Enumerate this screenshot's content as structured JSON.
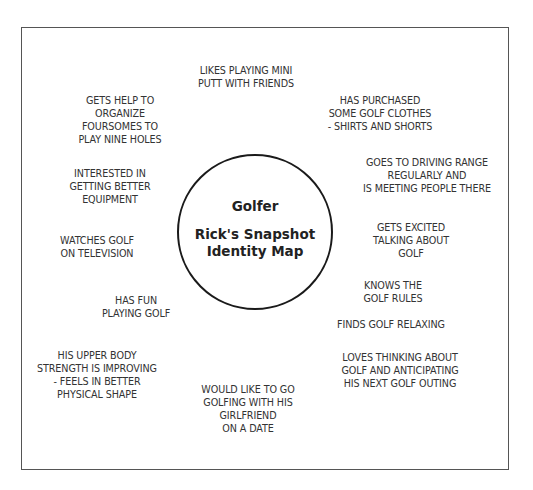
{
  "diagram": {
    "type": "identity-map",
    "center": {
      "title": "Golfer",
      "subtitle_line1": "Rick's Snapshot",
      "subtitle_line2": "Identity Map"
    },
    "notes": [
      {
        "id": "mini-putt",
        "text": "LIKES PLAYING MINI\nPUTT WITH FRIENDS"
      },
      {
        "id": "organize-foursomes",
        "text": "GETS HELP TO\nORGANIZE\nFOURSOMES TO\nPLAY NINE HOLES"
      },
      {
        "id": "golf-clothes",
        "text": "HAS PURCHASED\nSOME GOLF CLOTHES\n- SHIRTS AND SHORTS"
      },
      {
        "id": "better-equipment",
        "text": "INTERESTED IN\nGETTING BETTER\nEQUIPMENT"
      },
      {
        "id": "driving-range",
        "text": "GOES TO DRIVING RANGE\nREGULARLY AND\nIS MEETING PEOPLE THERE"
      },
      {
        "id": "watches-golf",
        "text": "WATCHES GOLF\nON TELEVISION"
      },
      {
        "id": "gets-excited",
        "text": "GETS EXCITED\nTALKING ABOUT\nGOLF"
      },
      {
        "id": "has-fun",
        "text": "HAS FUN\nPLAYING GOLF"
      },
      {
        "id": "knows-rules",
        "text": "KNOWS THE\nGOLF RULES"
      },
      {
        "id": "relaxing",
        "text": "FINDS GOLF RELAXING"
      },
      {
        "id": "upper-body",
        "text": "HIS UPPER BODY\nSTRENGTH IS IMPROVING\n- FEELS IN BETTER\nPHYSICAL SHAPE"
      },
      {
        "id": "loves-thinking",
        "text": "LOVES THINKING ABOUT\nGOLF AND ANTICIPATING\nHIS NEXT GOLF OUTING"
      },
      {
        "id": "girlfriend-date",
        "text": "WOULD LIKE TO GO\nGOLFING WITH HIS\nGIRLFRIEND\nON A DATE"
      }
    ]
  }
}
